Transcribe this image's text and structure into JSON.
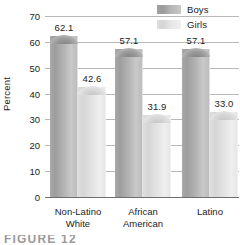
{
  "chart_data": {
    "type": "bar",
    "title": "",
    "xlabel": "",
    "ylabel": "Percent",
    "ylim": [
      0,
      70
    ],
    "yticks": [
      0,
      10,
      20,
      30,
      40,
      50,
      60,
      70
    ],
    "ytick_labels": [
      "0",
      "10",
      "20",
      "30",
      "40",
      "50",
      "60",
      "70"
    ],
    "grid": true,
    "legend_position": "top-right",
    "categories": [
      "Non-Latino White",
      "African American",
      "Latino"
    ],
    "category_lines": [
      [
        "Non-Latino",
        "White"
      ],
      [
        "African",
        "American"
      ],
      [
        "Latino",
        ""
      ]
    ],
    "series": [
      {
        "name": "Boys",
        "color": "#a9a9a9",
        "values": [
          62.1,
          57.1,
          57.1
        ],
        "value_labels": [
          "62.1",
          "57.1",
          "57.1"
        ]
      },
      {
        "name": "Girls",
        "color": "#dedede",
        "values": [
          42.6,
          31.9,
          33.0
        ],
        "value_labels": [
          "42.6",
          "31.9",
          "33.0"
        ]
      }
    ]
  },
  "legend": {
    "items": [
      {
        "label": "Boys",
        "swatch": "boys"
      },
      {
        "label": "Girls",
        "swatch": "girls"
      }
    ]
  },
  "caption": {
    "text": "FIGURE 12"
  }
}
